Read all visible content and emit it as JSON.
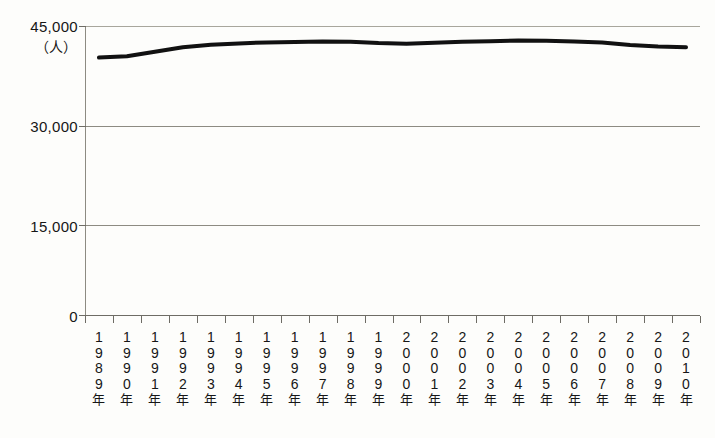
{
  "chart_data": {
    "type": "line",
    "title": "",
    "subtitle": "",
    "xlabel": "",
    "ylabel": "",
    "unit_label": "（人）",
    "ylim": [
      0,
      45000
    ],
    "yticks": [
      0,
      15000,
      30000,
      45000
    ],
    "ytick_labels": [
      "0",
      "15,000",
      "30,000",
      "45,000"
    ],
    "grid": true,
    "grid_axis": "y",
    "legend": false,
    "legend_position": "none",
    "line_color": "#111111",
    "line_width": 4,
    "categories": [
      "1989年",
      "1990年",
      "1991年",
      "1992年",
      "1993年",
      "1994年",
      "1995年",
      "1996年",
      "1997年",
      "1998年",
      "1999年",
      "2000年",
      "2001年",
      "2002年",
      "2003年",
      "2004年",
      "2005年",
      "2006年",
      "2007年",
      "2008年",
      "2009年",
      "2010年"
    ],
    "x": [
      1989,
      1990,
      1991,
      1992,
      1993,
      1994,
      1995,
      1996,
      1997,
      1998,
      1999,
      2000,
      2001,
      2002,
      2003,
      2004,
      2005,
      2006,
      2007,
      2008,
      2009,
      2010
    ],
    "values": [
      40100,
      40300,
      41000,
      41700,
      42100,
      42300,
      42450,
      42500,
      42600,
      42550,
      42350,
      42250,
      42400,
      42550,
      42650,
      42750,
      42700,
      42600,
      42450,
      42050,
      41800,
      41700
    ],
    "series": [
      {
        "name": "人数",
        "values": [
          40100,
          40300,
          41000,
          41700,
          42100,
          42300,
          42450,
          42500,
          42600,
          42550,
          42350,
          42250,
          42400,
          42550,
          42650,
          42750,
          42700,
          42600,
          42450,
          42050,
          41800,
          41700
        ]
      }
    ]
  }
}
